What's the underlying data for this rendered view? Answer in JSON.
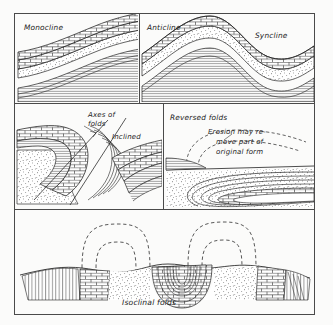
{
  "figure": {
    "type": "geological-cross-section-plate",
    "caption": "Isoclinal folds",
    "paper_color": "#fbfbfa",
    "ink_color": "#1c1c1c"
  },
  "panels": [
    {
      "id": "monocline",
      "position": "top-left",
      "labels": [
        {
          "text": "Monocline",
          "role": "panel-title"
        }
      ],
      "description": "Strata stepping down in a single flexure; brick-patterned limestone over stippled sandstone over banded shale."
    },
    {
      "id": "anticline-syncline",
      "position": "top-right",
      "labels": [
        {
          "text": "Anticline",
          "role": "fold-label"
        },
        {
          "text": "Syncline",
          "role": "fold-label"
        }
      ],
      "description": "One upfold and one downfold in conformable strata."
    },
    {
      "id": "axes-of-folds",
      "position": "middle-left",
      "labels": [
        {
          "text": "Axes of",
          "role": "annotation-line"
        },
        {
          "text": "folds",
          "role": "annotation-line"
        },
        {
          "text": "Inclined",
          "role": "annotation"
        }
      ],
      "description": "Overturned fold with two inclined axial trace lines drawn through the hinge."
    },
    {
      "id": "reversed-folds",
      "position": "middle-right",
      "labels": [
        {
          "text": "Reversed folds",
          "role": "panel-title"
        },
        {
          "text": "Erosion may re-",
          "role": "annotation-line"
        },
        {
          "text": "move part of",
          "role": "annotation-line"
        },
        {
          "text": "original form",
          "role": "annotation-line"
        }
      ],
      "description": "Recumbent fold nose with dashed outline showing the eroded original form."
    },
    {
      "id": "isoclinal-folds",
      "position": "bottom",
      "labels": [
        {
          "text": "Isoclinal folds",
          "role": "caption"
        }
      ],
      "description": "Tightly compressed parallel folds; dashed arcs above the land surface indicate removed anticlinal crests."
    }
  ],
  "legend": {
    "rock_units": [
      {
        "name": "limestone",
        "pattern": "brick"
      },
      {
        "name": "sandstone",
        "pattern": "stipple"
      },
      {
        "name": "shale",
        "pattern": "fine-parallel-lines"
      }
    ]
  }
}
